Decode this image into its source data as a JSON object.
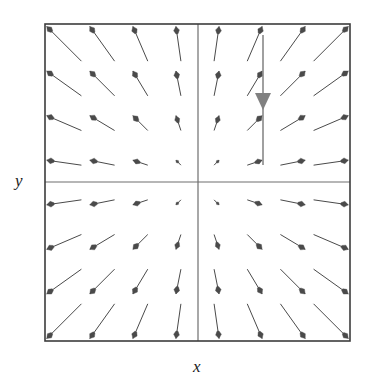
{
  "figure": {
    "name": "vector-field-plot",
    "background_color": "#ffffff",
    "frame": {
      "x": 45,
      "y": 24,
      "width": 305,
      "height": 317,
      "stroke_color": "#3c3c3c",
      "stroke_width": 1.6
    },
    "quadrant_divider": {
      "center_x": 198,
      "center_y": 182,
      "stroke_color": "#6e6e6e",
      "stroke_width": 1.2
    },
    "axis_labels": {
      "x": "x",
      "y": "y"
    }
  },
  "chart_data": {
    "type": "scatter",
    "subtype": "vector-field",
    "title": "",
    "xlabel": "x",
    "ylabel": "y",
    "xlim": [
      -2,
      2
    ],
    "ylim": [
      -2,
      2
    ],
    "grid": false,
    "legend": null,
    "field_formula": {
      "u": "x",
      "v": "y"
    },
    "grid_columns": 8,
    "grid_rows": 8,
    "arrow_color": "#4a4a4a",
    "arrow_stroke_width": 1.0,
    "x": [
      -1.75,
      -1.25,
      -0.75,
      -0.25,
      0.25,
      0.75,
      1.25,
      1.75
    ],
    "y": [
      1.75,
      1.25,
      0.75,
      0.25,
      -0.25,
      -0.75,
      -1.25,
      -1.75
    ],
    "vectors": [
      {
        "x": -1.75,
        "y": 1.75,
        "u": -1.75,
        "v": 1.75
      },
      {
        "x": -1.25,
        "y": 1.75,
        "u": -1.25,
        "v": 1.75
      },
      {
        "x": -0.75,
        "y": 1.75,
        "u": -0.75,
        "v": 1.75
      },
      {
        "x": -0.25,
        "y": 1.75,
        "u": -0.25,
        "v": 1.75
      },
      {
        "x": 0.25,
        "y": 1.75,
        "u": 0.25,
        "v": 1.75
      },
      {
        "x": 0.75,
        "y": 1.75,
        "u": 0.75,
        "v": 1.75
      },
      {
        "x": 1.25,
        "y": 1.75,
        "u": 1.25,
        "v": 1.75
      },
      {
        "x": 1.75,
        "y": 1.75,
        "u": 1.75,
        "v": 1.75
      },
      {
        "x": -1.75,
        "y": 1.25,
        "u": -1.75,
        "v": 1.25
      },
      {
        "x": -1.25,
        "y": 1.25,
        "u": -1.25,
        "v": 1.25
      },
      {
        "x": -0.75,
        "y": 1.25,
        "u": -0.75,
        "v": 1.25
      },
      {
        "x": -0.25,
        "y": 1.25,
        "u": -0.25,
        "v": 1.25
      },
      {
        "x": 0.25,
        "y": 1.25,
        "u": 0.25,
        "v": 1.25
      },
      {
        "x": 0.75,
        "y": 1.25,
        "u": 0.75,
        "v": 1.25
      },
      {
        "x": 1.25,
        "y": 1.25,
        "u": 1.25,
        "v": 1.25
      },
      {
        "x": 1.75,
        "y": 1.25,
        "u": 1.75,
        "v": 1.25
      },
      {
        "x": -1.75,
        "y": 0.75,
        "u": -1.75,
        "v": 0.75
      },
      {
        "x": -1.25,
        "y": 0.75,
        "u": -1.25,
        "v": 0.75
      },
      {
        "x": -0.75,
        "y": 0.75,
        "u": -0.75,
        "v": 0.75
      },
      {
        "x": -0.25,
        "y": 0.75,
        "u": -0.25,
        "v": 0.75
      },
      {
        "x": 0.25,
        "y": 0.75,
        "u": 0.25,
        "v": 0.75
      },
      {
        "x": 0.75,
        "y": 0.75,
        "u": 0.75,
        "v": 0.75
      },
      {
        "x": 1.25,
        "y": 0.75,
        "u": 1.25,
        "v": 0.75
      },
      {
        "x": 1.75,
        "y": 0.75,
        "u": 1.75,
        "v": 0.75
      },
      {
        "x": -1.75,
        "y": 0.25,
        "u": -1.75,
        "v": 0.25
      },
      {
        "x": -1.25,
        "y": 0.25,
        "u": -1.25,
        "v": 0.25
      },
      {
        "x": -0.75,
        "y": 0.25,
        "u": -0.75,
        "v": 0.25
      },
      {
        "x": -0.25,
        "y": 0.25,
        "u": -0.25,
        "v": 0.25
      },
      {
        "x": 0.25,
        "y": 0.25,
        "u": 0.25,
        "v": 0.25
      },
      {
        "x": 0.75,
        "y": 0.25,
        "u": 0.75,
        "v": 0.25
      },
      {
        "x": 1.25,
        "y": 0.25,
        "u": 1.25,
        "v": 0.25
      },
      {
        "x": 1.75,
        "y": 0.25,
        "u": 1.75,
        "v": 0.25
      },
      {
        "x": -1.75,
        "y": -0.25,
        "u": -1.75,
        "v": -0.25
      },
      {
        "x": -1.25,
        "y": -0.25,
        "u": -1.25,
        "v": -0.25
      },
      {
        "x": -0.75,
        "y": -0.25,
        "u": -0.75,
        "v": -0.25
      },
      {
        "x": -0.25,
        "y": -0.25,
        "u": -0.25,
        "v": -0.25
      },
      {
        "x": 0.25,
        "y": -0.25,
        "u": 0.25,
        "v": -0.25
      },
      {
        "x": 0.75,
        "y": -0.25,
        "u": 0.75,
        "v": -0.25
      },
      {
        "x": 1.25,
        "y": -0.25,
        "u": 1.25,
        "v": -0.25
      },
      {
        "x": 1.75,
        "y": -0.25,
        "u": 1.75,
        "v": -0.25
      },
      {
        "x": -1.75,
        "y": -0.75,
        "u": -1.75,
        "v": -0.75
      },
      {
        "x": -1.25,
        "y": -0.75,
        "u": -1.25,
        "v": -0.75
      },
      {
        "x": -0.75,
        "y": -0.75,
        "u": -0.75,
        "v": -0.75
      },
      {
        "x": -0.25,
        "y": -0.75,
        "u": -0.25,
        "v": -0.75
      },
      {
        "x": 0.25,
        "y": -0.75,
        "u": 0.25,
        "v": -0.75
      },
      {
        "x": 0.75,
        "y": -0.75,
        "u": 0.75,
        "v": -0.75
      },
      {
        "x": 1.25,
        "y": -0.75,
        "u": 1.25,
        "v": -0.75
      },
      {
        "x": 1.75,
        "y": -0.75,
        "u": 1.75,
        "v": -0.75
      },
      {
        "x": -1.75,
        "y": -1.25,
        "u": -1.75,
        "v": -1.25
      },
      {
        "x": -1.25,
        "y": -1.25,
        "u": -1.25,
        "v": -1.25
      },
      {
        "x": -0.75,
        "y": -1.25,
        "u": -0.75,
        "v": -1.25
      },
      {
        "x": -0.25,
        "y": -1.25,
        "u": -0.25,
        "v": -1.25
      },
      {
        "x": 0.25,
        "y": -1.25,
        "u": 0.25,
        "v": -1.25
      },
      {
        "x": 0.75,
        "y": -1.25,
        "u": 0.75,
        "v": -1.25
      },
      {
        "x": 1.25,
        "y": -1.25,
        "u": 1.25,
        "v": -1.25
      },
      {
        "x": 1.75,
        "y": -1.25,
        "u": 1.75,
        "v": -1.25
      },
      {
        "x": -1.75,
        "y": -1.75,
        "u": -1.75,
        "v": -1.75
      },
      {
        "x": -1.25,
        "y": -1.75,
        "u": -1.25,
        "v": -1.75
      },
      {
        "x": -0.75,
        "y": -1.75,
        "u": -0.75,
        "v": -1.75
      },
      {
        "x": -0.25,
        "y": -1.75,
        "u": -0.25,
        "v": -1.75
      },
      {
        "x": 0.25,
        "y": -1.75,
        "u": 0.25,
        "v": -1.75
      },
      {
        "x": 0.75,
        "y": -1.75,
        "u": 0.75,
        "v": -1.75
      },
      {
        "x": 1.25,
        "y": -1.75,
        "u": 1.25,
        "v": -1.75
      },
      {
        "x": 1.75,
        "y": -1.75,
        "u": 1.75,
        "v": -1.75
      }
    ],
    "annotations": [
      {
        "name": "downward-trajectory-arrow",
        "type": "arrow",
        "color": "#808080",
        "from": {
          "px_x": 263,
          "px_y": 35
        },
        "to": {
          "px_x": 263,
          "px_y": 165
        },
        "head_at": {
          "px_x": 263,
          "px_y": 110
        },
        "head_width": 16,
        "head_length": 17,
        "stroke_width": 1.5,
        "direction": "down"
      }
    ]
  }
}
